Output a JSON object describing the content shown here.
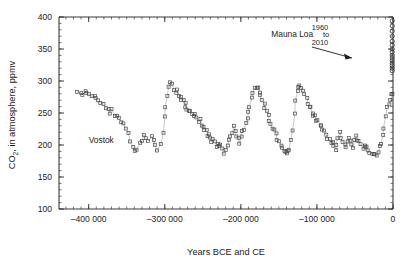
{
  "chart_data": {
    "type": "scatter",
    "title": "",
    "xlabel": "Years BCE and CE",
    "ylabel": "CO2, in atmosphere, ppmv",
    "ylabel_parts": {
      "main": "CO",
      "sub": "2",
      "rest": ", in atmosphere, ppmv"
    },
    "xlim": [
      -439000,
      0
    ],
    "ylim": [
      100,
      400
    ],
    "xticks": [
      -400000,
      -300000,
      -200000,
      -100000,
      0
    ],
    "xticklabels": [
      "–400 000",
      "–300 000",
      "–200 000",
      "–100 000",
      "0"
    ],
    "yticks": [
      100,
      150,
      200,
      250,
      300,
      350,
      400
    ],
    "yticklabels": [
      "100",
      "150",
      "200",
      "250",
      "300",
      "350",
      "400"
    ],
    "x_minor_step": 10000,
    "y_minor_step": 10,
    "grid": false,
    "legend": "none",
    "annotations": [
      {
        "name": "vostok-label",
        "text": "Vostok",
        "x": -400000,
        "y": 203
      },
      {
        "name": "mauna-loa-label",
        "text": "Mauna Loa",
        "x": -160000,
        "y": 368
      },
      {
        "name": "mauna-loa-year-start",
        "text": "1960",
        "x": -96000,
        "y": 380
      },
      {
        "name": "mauna-loa-year-to",
        "text": "to",
        "x": -88000,
        "y": 368
      },
      {
        "name": "mauna-loa-year-end",
        "text": "2010",
        "x": -96000,
        "y": 356
      }
    ],
    "series": [
      {
        "name": "Vostok",
        "marker": "open-square",
        "color": "#4a4a4a",
        "connected": true,
        "points": [
          [
            -414000,
            284
          ],
          [
            -411000,
            283
          ],
          [
            -408000,
            280
          ],
          [
            -405000,
            285
          ],
          [
            -402000,
            281
          ],
          [
            -399000,
            277
          ],
          [
            -396000,
            274
          ],
          [
            -393000,
            277
          ],
          [
            -390000,
            272
          ],
          [
            -387000,
            268
          ],
          [
            -384000,
            265
          ],
          [
            -381000,
            262
          ],
          [
            -378000,
            259
          ],
          [
            -375000,
            256
          ],
          [
            -372000,
            252
          ],
          [
            -369000,
            255
          ],
          [
            -366000,
            248
          ],
          [
            -363000,
            244
          ],
          [
            -360000,
            240
          ],
          [
            -357000,
            236
          ],
          [
            -354000,
            232
          ],
          [
            -351000,
            226
          ],
          [
            -348000,
            218
          ],
          [
            -345000,
            207
          ],
          [
            -342000,
            196
          ],
          [
            -339000,
            190
          ],
          [
            -336000,
            194
          ],
          [
            -333000,
            201
          ],
          [
            -330000,
            209
          ],
          [
            -327000,
            215
          ],
          [
            -324000,
            210
          ],
          [
            -321000,
            206
          ],
          [
            -318000,
            213
          ],
          [
            -315000,
            205
          ],
          [
            -312000,
            199
          ],
          [
            -309000,
            194
          ],
          [
            -306000,
            203
          ],
          [
            -303000,
            222
          ],
          [
            -300000,
            245
          ],
          [
            -298000,
            262
          ],
          [
            -296000,
            278
          ],
          [
            -294000,
            290
          ],
          [
            -292000,
            298
          ],
          [
            -290000,
            294
          ],
          [
            -288000,
            287
          ],
          [
            -286000,
            281
          ],
          [
            -284000,
            286
          ],
          [
            -282000,
            278
          ],
          [
            -280000,
            272
          ],
          [
            -278000,
            276
          ],
          [
            -276000,
            268
          ],
          [
            -274000,
            262
          ],
          [
            -272000,
            266
          ],
          [
            -270000,
            258
          ],
          [
            -268000,
            252
          ],
          [
            -266000,
            256
          ],
          [
            -264000,
            248
          ],
          [
            -262000,
            243
          ],
          [
            -260000,
            247
          ],
          [
            -258000,
            240
          ],
          [
            -256000,
            234
          ],
          [
            -254000,
            238
          ],
          [
            -252000,
            230
          ],
          [
            -250000,
            224
          ],
          [
            -248000,
            229
          ],
          [
            -246000,
            221
          ],
          [
            -244000,
            215
          ],
          [
            -242000,
            219
          ],
          [
            -240000,
            212
          ],
          [
            -238000,
            206
          ],
          [
            -236000,
            210
          ],
          [
            -234000,
            203
          ],
          [
            -232000,
            198
          ],
          [
            -230000,
            202
          ],
          [
            -228000,
            196
          ],
          [
            -226000,
            200
          ],
          [
            -224000,
            193
          ],
          [
            -222000,
            189
          ],
          [
            -220000,
            194
          ],
          [
            -218000,
            200
          ],
          [
            -216000,
            207
          ],
          [
            -214000,
            214
          ],
          [
            -212000,
            221
          ],
          [
            -210000,
            228
          ],
          [
            -208000,
            222
          ],
          [
            -206000,
            216
          ],
          [
            -204000,
            210
          ],
          [
            -202000,
            205
          ],
          [
            -200000,
            212
          ],
          [
            -198000,
            219
          ],
          [
            -196000,
            226
          ],
          [
            -194000,
            234
          ],
          [
            -192000,
            242
          ],
          [
            -190000,
            252
          ],
          [
            -188000,
            262
          ],
          [
            -186000,
            272
          ],
          [
            -184000,
            280
          ],
          [
            -182000,
            287
          ],
          [
            -180000,
            292
          ],
          [
            -178000,
            288
          ],
          [
            -176000,
            282
          ],
          [
            -174000,
            276
          ],
          [
            -172000,
            270
          ],
          [
            -170000,
            264
          ],
          [
            -168000,
            258
          ],
          [
            -166000,
            252
          ],
          [
            -164000,
            246
          ],
          [
            -162000,
            240
          ],
          [
            -160000,
            234
          ],
          [
            -158000,
            228
          ],
          [
            -156000,
            222
          ],
          [
            -154000,
            216
          ],
          [
            -152000,
            210
          ],
          [
            -150000,
            205
          ],
          [
            -148000,
            200
          ],
          [
            -146000,
            195
          ],
          [
            -144000,
            192
          ],
          [
            -142000,
            189
          ],
          [
            -140000,
            186
          ],
          [
            -138000,
            190
          ],
          [
            -136000,
            194
          ],
          [
            -134000,
            205
          ],
          [
            -132000,
            225
          ],
          [
            -130000,
            248
          ],
          [
            -128000,
            268
          ],
          [
            -126000,
            282
          ],
          [
            -124000,
            289
          ],
          [
            -122000,
            293
          ],
          [
            -120000,
            288
          ],
          [
            -118000,
            283
          ],
          [
            -116000,
            278
          ],
          [
            -114000,
            272
          ],
          [
            -112000,
            266
          ],
          [
            -110000,
            262
          ],
          [
            -108000,
            258
          ],
          [
            -106000,
            252
          ],
          [
            -104000,
            248
          ],
          [
            -102000,
            244
          ],
          [
            -100000,
            240
          ],
          [
            -98000,
            236
          ],
          [
            -96000,
            232
          ],
          [
            -94000,
            228
          ],
          [
            -92000,
            224
          ],
          [
            -90000,
            220
          ],
          [
            -88000,
            216
          ],
          [
            -86000,
            212
          ],
          [
            -84000,
            208
          ],
          [
            -82000,
            205
          ],
          [
            -80000,
            202
          ],
          [
            -78000,
            198
          ],
          [
            -76000,
            195
          ],
          [
            -74000,
            200
          ],
          [
            -72000,
            210
          ],
          [
            -70000,
            218
          ],
          [
            -68000,
            212
          ],
          [
            -66000,
            206
          ],
          [
            -64000,
            200
          ],
          [
            -62000,
            196
          ],
          [
            -60000,
            205
          ],
          [
            -58000,
            214
          ],
          [
            -56000,
            208
          ],
          [
            -54000,
            202
          ],
          [
            -52000,
            198
          ],
          [
            -50000,
            206
          ],
          [
            -48000,
            212
          ],
          [
            -46000,
            208
          ],
          [
            -44000,
            204
          ],
          [
            -42000,
            200
          ],
          [
            -40000,
            197
          ],
          [
            -38000,
            202
          ],
          [
            -36000,
            199
          ],
          [
            -34000,
            195
          ],
          [
            -32000,
            192
          ],
          [
            -30000,
            190
          ],
          [
            -28000,
            188
          ],
          [
            -26000,
            186
          ],
          [
            -24000,
            184
          ],
          [
            -22000,
            186
          ],
          [
            -20000,
            190
          ],
          [
            -18000,
            196
          ],
          [
            -16000,
            204
          ],
          [
            -14000,
            214
          ],
          [
            -12000,
            228
          ],
          [
            -10000,
            244
          ],
          [
            -8000,
            258
          ],
          [
            -6000,
            266
          ],
          [
            -4000,
            272
          ],
          [
            -2000,
            278
          ],
          [
            -1000,
            282
          ]
        ]
      },
      {
        "name": "Mauna Loa",
        "marker": "open-circle",
        "color": "#2e2e2e",
        "connected": false,
        "points": [
          [
            -1000,
            316
          ],
          [
            -1000,
            320
          ],
          [
            -1000,
            324
          ],
          [
            -1000,
            328
          ],
          [
            -1000,
            332
          ],
          [
            -1000,
            336
          ],
          [
            -1000,
            340
          ],
          [
            -1000,
            345
          ],
          [
            -1000,
            350
          ],
          [
            -1000,
            356
          ],
          [
            -1000,
            362
          ],
          [
            -1000,
            370
          ],
          [
            -1000,
            378
          ],
          [
            -1000,
            386
          ],
          [
            -1000,
            394
          ]
        ]
      }
    ]
  }
}
